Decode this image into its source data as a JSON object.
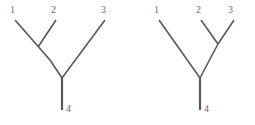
{
  "figure": {
    "background_color": "#ffffff",
    "line_color": "#585858",
    "label_color": "#6b6b6b",
    "width": 255,
    "height": 125
  },
  "trees": [
    {
      "id": "left-tree",
      "name": "tree-a",
      "topology": "((1,2),3),4",
      "labels": [
        {
          "text": "1",
          "x": 10,
          "y": 5
        },
        {
          "text": "2",
          "x": 51,
          "y": 5
        },
        {
          "text": "3",
          "x": 101,
          "y": 5
        },
        {
          "text": "4",
          "x": 66,
          "y": 104
        }
      ],
      "branches": [
        {
          "name": "leaf-1-branch",
          "x1": 15,
          "y1": 20,
          "x2": 50,
          "y2": 60
        },
        {
          "name": "leaf-2-branch",
          "x1": 56,
          "y1": 20,
          "x2": 38,
          "y2": 47
        },
        {
          "name": "internal-12-branch",
          "x1": 50,
          "y1": 60,
          "x2": 62,
          "y2": 78
        },
        {
          "name": "leaf-3-branch",
          "x1": 105,
          "y1": 20,
          "x2": 62,
          "y2": 78
        }
      ],
      "stem": {
        "name": "root-stem-4",
        "x1": 62,
        "y1": 78,
        "x2": 62,
        "y2": 110
      }
    },
    {
      "id": "right-tree",
      "name": "tree-b",
      "topology": "(1,(2,3)),4",
      "labels": [
        {
          "text": "1",
          "x": 154,
          "y": 5
        },
        {
          "text": "2",
          "x": 196,
          "y": 5
        },
        {
          "text": "3",
          "x": 228,
          "y": 5
        },
        {
          "text": "4",
          "x": 204,
          "y": 104
        }
      ],
      "branches": [
        {
          "name": "leaf-1-branch",
          "x1": 159,
          "y1": 20,
          "x2": 200,
          "y2": 78
        },
        {
          "name": "leaf-2-branch",
          "x1": 201,
          "y1": 20,
          "x2": 218,
          "y2": 44
        },
        {
          "name": "leaf-3-branch",
          "x1": 234,
          "y1": 20,
          "x2": 218,
          "y2": 44
        },
        {
          "name": "internal-23-branch",
          "x1": 218,
          "y1": 44,
          "x2": 200,
          "y2": 78
        }
      ],
      "stem": {
        "name": "root-stem-4",
        "x1": 200,
        "y1": 78,
        "x2": 200,
        "y2": 110
      }
    }
  ]
}
